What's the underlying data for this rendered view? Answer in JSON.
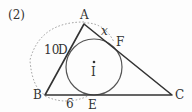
{
  "problem_number": "(2)",
  "points": {
    "A": {
      "label": "A",
      "x": 84,
      "y": 24
    },
    "B": {
      "label": "B",
      "x": 45,
      "y": 95
    },
    "C": {
      "label": "C",
      "x": 172,
      "y": 95
    },
    "D": {
      "label": "D",
      "x": 67,
      "y": 55
    },
    "E": {
      "label": "E",
      "x": 88,
      "y": 95
    },
    "F": {
      "label": "F",
      "x": 114,
      "y": 43
    },
    "I": {
      "label": "I",
      "x": 94,
      "y": 67
    }
  },
  "measurements": {
    "AB": "10",
    "BE": "6",
    "AF": "x"
  },
  "colors": {
    "triangle": "#333333",
    "circle": "#555555",
    "dotted_arc": "#999999",
    "text": "#333333"
  }
}
